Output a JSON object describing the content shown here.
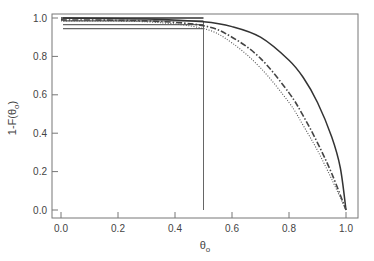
{
  "chart_data": {
    "type": "line",
    "title": "",
    "xlabel": "θo",
    "ylabel": "1-F(θo)",
    "xlim": [
      0.0,
      1.0
    ],
    "ylim": [
      0.0,
      1.0
    ],
    "grid": false,
    "legend": null,
    "xticks": [
      "0.0",
      "0.2",
      "0.4",
      "0.6",
      "0.8",
      "1.0"
    ],
    "yticks": [
      "0.0",
      "0.2",
      "0.4",
      "0.6",
      "0.8",
      "1.0"
    ],
    "series": [
      {
        "name": "solid",
        "style": "solid",
        "x": [
          0.0,
          0.3,
          0.5,
          0.6,
          0.7,
          0.8,
          0.85,
          0.9,
          0.95,
          0.98,
          1.0
        ],
        "y": [
          1.0,
          0.995,
          0.98,
          0.955,
          0.9,
          0.78,
          0.69,
          0.56,
          0.38,
          0.22,
          0.0
        ]
      },
      {
        "name": "dash-dot",
        "style": "dashdot",
        "x": [
          0.0,
          0.3,
          0.5,
          0.6,
          0.7,
          0.8,
          0.85,
          0.9,
          0.95,
          1.0
        ],
        "y": [
          0.99,
          0.985,
          0.96,
          0.9,
          0.79,
          0.61,
          0.49,
          0.35,
          0.19,
          0.0
        ]
      },
      {
        "name": "dotted",
        "style": "dotted",
        "x": [
          0.0,
          0.3,
          0.5,
          0.6,
          0.7,
          0.8,
          0.85,
          0.9,
          0.95,
          1.0
        ],
        "y": [
          0.985,
          0.98,
          0.945,
          0.87,
          0.74,
          0.56,
          0.44,
          0.31,
          0.16,
          0.0
        ]
      }
    ],
    "annotations": {
      "horizontal_lines": [
        {
          "y": 1.0,
          "x_from": 0.0,
          "x_to": 0.5
        },
        {
          "y": 0.985,
          "x_from": 0.0,
          "x_to": 0.5
        },
        {
          "y": 0.965,
          "x_from": 0.0,
          "x_to": 0.5
        },
        {
          "y": 0.945,
          "x_from": 0.0,
          "x_to": 0.5
        }
      ],
      "vertical_line": {
        "x": 0.5,
        "y_from": 0.0,
        "y_to": 0.98
      }
    }
  }
}
